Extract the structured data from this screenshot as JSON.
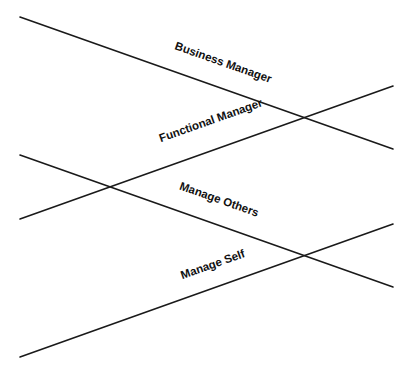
{
  "diagram": {
    "type": "crossing-lines",
    "line_color": "#1a1a1a",
    "lines": [
      {
        "id": "business-manager",
        "label": "Business Manager",
        "x1": 20,
        "y1": 17,
        "x2": 393,
        "y2": 149,
        "label_x": 222,
        "label_y": 66,
        "angle": 19.5
      },
      {
        "id": "functional-manager",
        "label": "Functional Manager",
        "x1": 20,
        "y1": 219,
        "x2": 393,
        "y2": 86,
        "label_x": 212,
        "label_y": 124,
        "angle": -19.5
      },
      {
        "id": "manage-others",
        "label": "Manage Others",
        "x1": 20,
        "y1": 155,
        "x2": 393,
        "y2": 287,
        "label_x": 218,
        "label_y": 203,
        "angle": 19.5
      },
      {
        "id": "manage-self",
        "label": "Manage Self",
        "x1": 20,
        "y1": 357,
        "x2": 393,
        "y2": 224,
        "label_x": 214,
        "label_y": 268,
        "angle": -19.5
      }
    ],
    "crossings": [
      {
        "between": [
          "business-manager",
          "functional-manager"
        ],
        "x": 303,
        "y": 118
      },
      {
        "between": [
          "functional-manager",
          "manage-others"
        ],
        "x": 110,
        "y": 187
      },
      {
        "between": [
          "manage-others",
          "manage-self"
        ],
        "x": 303,
        "y": 256
      }
    ]
  }
}
